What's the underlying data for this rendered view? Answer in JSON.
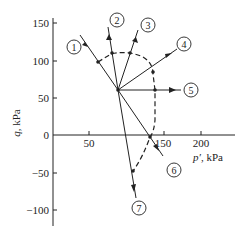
{
  "diagram": {
    "title": "",
    "x_axis": {
      "label_var": "p′",
      "label_unit": ", kPa",
      "ticks": [
        {
          "value": 50,
          "label": "50"
        },
        {
          "value": 150,
          "label": "150"
        },
        {
          "value": 200,
          "label": "200"
        }
      ]
    },
    "y_axis": {
      "label_var": "q",
      "label_unit": ", kPa",
      "ticks": [
        {
          "value": 150,
          "label": "150"
        },
        {
          "value": 100,
          "label": "100"
        },
        {
          "value": 50,
          "label": "50"
        },
        {
          "value": 0,
          "label": "0"
        },
        {
          "value": -50,
          "label": "−50"
        },
        {
          "value": -100,
          "label": "−100"
        }
      ]
    },
    "origin_point": {
      "p": 87,
      "q": 60
    },
    "stress_paths": [
      {
        "id": "1",
        "label": "1",
        "end": {
          "p": 37,
          "q": 133
        }
      },
      {
        "id": "2",
        "label": "2",
        "end": {
          "p": 73,
          "q": 144
        }
      },
      {
        "id": "3",
        "label": "3",
        "end": {
          "p": 113,
          "q": 139
        }
      },
      {
        "id": "4",
        "label": "4",
        "end": {
          "p": 155,
          "q": 104
        }
      },
      {
        "id": "5",
        "label": "5",
        "end": {
          "p": 170,
          "q": 60
        }
      },
      {
        "id": "6",
        "label": "6",
        "end": {
          "p": 147,
          "q": -27
        }
      },
      {
        "id": "7",
        "label": "7",
        "end": {
          "p": 111,
          "q": -84
        }
      }
    ],
    "failure_envelope": {
      "style": "dashed",
      "points_on_paths": [
        {
          "path": "1",
          "p": 61,
          "q": 97
        },
        {
          "path": "2",
          "p": 79,
          "q": 109
        },
        {
          "path": "3",
          "p": 101,
          "q": 109
        },
        {
          "path": "4",
          "p": 134,
          "q": 84
        },
        {
          "path": "5",
          "p": 137,
          "q": 60
        },
        {
          "path": "6",
          "p": 131,
          "q": -3
        },
        {
          "path": "7",
          "p": 107,
          "q": -48
        }
      ]
    }
  }
}
